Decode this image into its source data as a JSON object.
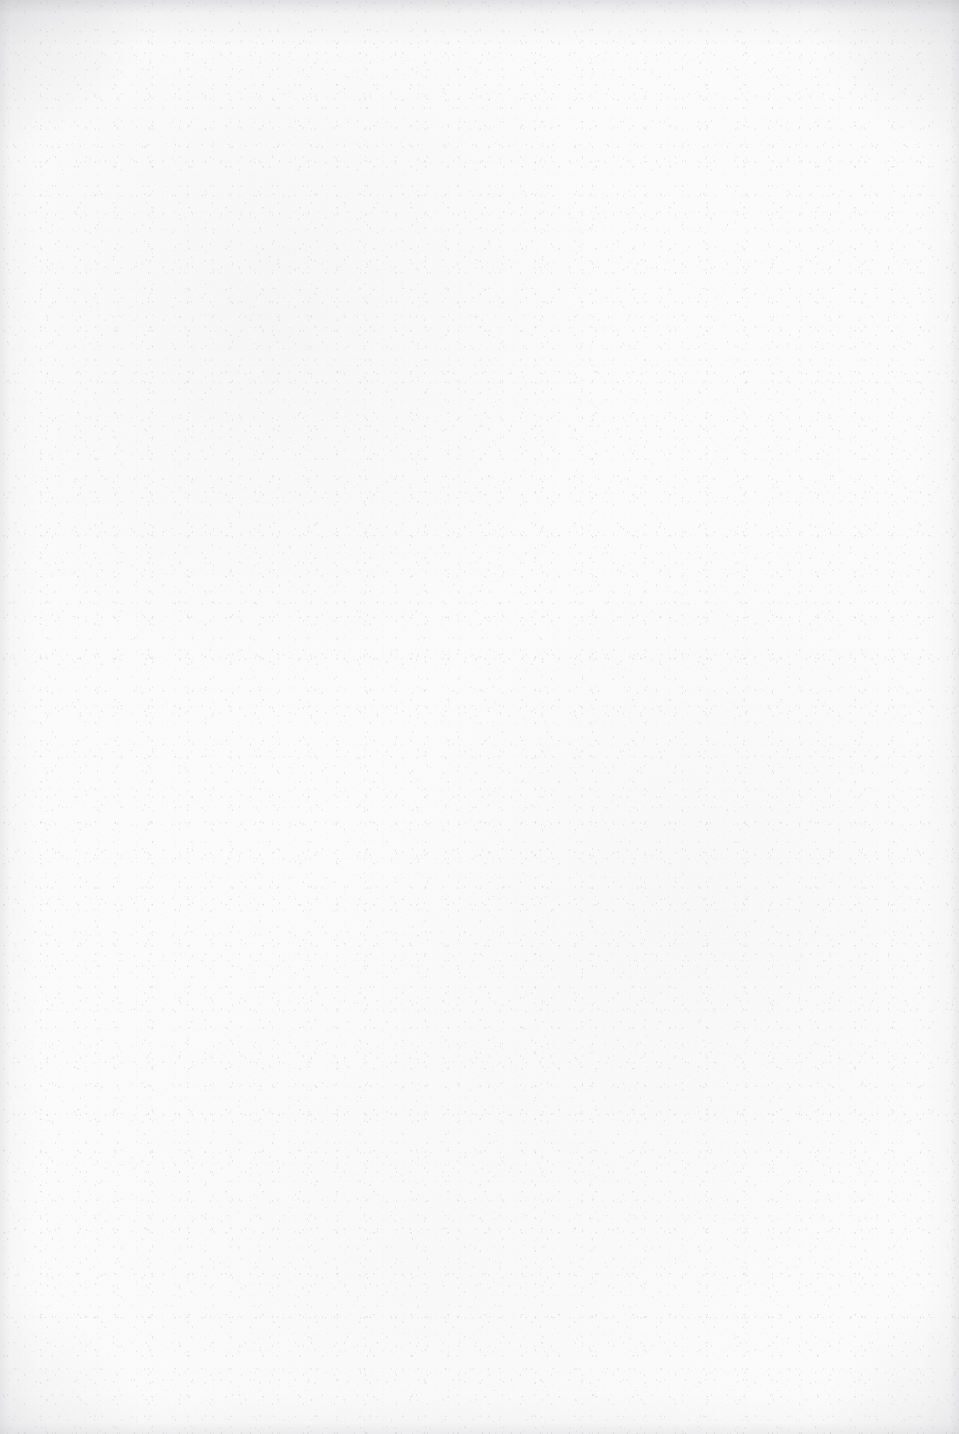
{
  "page": {
    "kind": "blank-scanned-page",
    "width": 959,
    "height": 1434,
    "orientation": "portrait",
    "has_visible_text": false,
    "has_figures": false,
    "has_tables": false,
    "visible_text": "",
    "blank_label": ""
  },
  "appearance": {
    "paper_color": "#fbfbfb",
    "paper_color_light": "#fdfdfd",
    "paper_color_shadow": "#f5f5f6",
    "speckle_color": "#787880",
    "edge_vignette_color": "#afafb4",
    "corner_shadow_color": "#aaaab0",
    "background_outside": "#ffffff"
  },
  "texture": {
    "description": "fine random grey scanner speckle across the whole sheet",
    "edges": "soft darker grain band along all four edges, heaviest along the top edge and the upper corners",
    "grain_opacity": 0.55
  }
}
